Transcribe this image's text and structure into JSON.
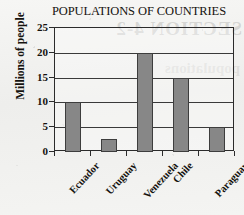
{
  "chart_data": {
    "type": "bar",
    "title": "POPULATIONS OF COUNTRIES",
    "xlabel": "",
    "ylabel": "Millions of people",
    "categories": [
      "Ecuador",
      "Uruguay",
      "Venezuela",
      "Chile",
      "Paraguay"
    ],
    "values": [
      10,
      2.7,
      20,
      15,
      5
    ],
    "ylim": [
      0,
      25
    ],
    "ytick_labels": [
      "0",
      "5",
      "10",
      "15",
      "20",
      "25"
    ],
    "ytick_values": [
      0,
      5,
      10,
      15,
      20,
      25
    ],
    "grid": "horizontal",
    "legend": "none",
    "bar_color": "#878787",
    "bar_edge_color": "#3d3d3d",
    "axis_color": "#2b2b2b",
    "text_color": "#15130f",
    "background_color": "#f2f2f0"
  },
  "artifacts": {
    "ghost_line_1": "SECTION 4-2",
    "ghost_line_2": "populations"
  }
}
